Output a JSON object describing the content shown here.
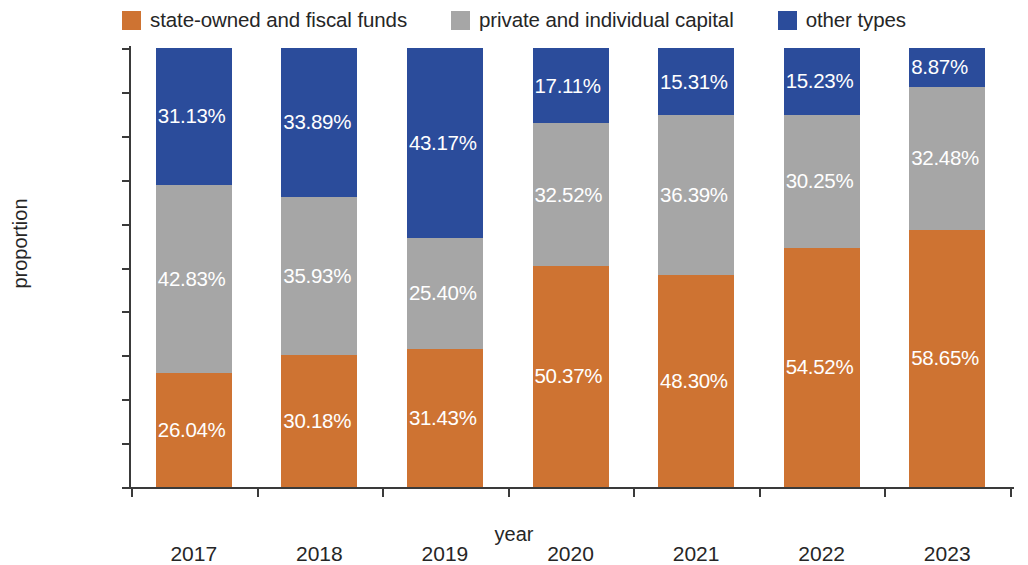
{
  "chart_data": {
    "type": "bar",
    "subtype": "stacked-percent",
    "title": "",
    "xlabel": "year",
    "ylabel": "proportion",
    "categories": [
      "2017",
      "2018",
      "2019",
      "2020",
      "2021",
      "2022",
      "2023"
    ],
    "ylim": [
      0,
      100
    ],
    "ytick_labels": [
      "100.00%",
      "90.00%",
      "80.00%",
      "70.00%",
      "60.00%",
      "50.00%",
      "40.00%",
      "30.00%",
      "20.00%",
      "10.00%",
      "0"
    ],
    "ytick_values": [
      100,
      90,
      80,
      70,
      60,
      50,
      40,
      30,
      20,
      10,
      0
    ],
    "grid": false,
    "legend_position": "top-center",
    "series": [
      {
        "name": "state-owned and fiscal funds",
        "color": "#CE7332",
        "values": [
          26.04,
          30.18,
          31.43,
          50.37,
          48.3,
          54.52,
          58.65
        ],
        "labels": [
          "26.04%",
          "30.18%",
          "31.43%",
          "50.37%",
          "48.30%",
          "54.52%",
          "58.65%"
        ]
      },
      {
        "name": "private and individual capital",
        "color": "#A6A6A6",
        "values": [
          42.83,
          35.93,
          25.4,
          32.52,
          36.39,
          30.25,
          32.48
        ],
        "labels": [
          "42.83%",
          "35.93%",
          "25.40%",
          "32.52%",
          "36.39%",
          "30.25%",
          "32.48%"
        ]
      },
      {
        "name": "other types",
        "color": "#2B4C9B",
        "values": [
          31.13,
          33.89,
          43.17,
          17.11,
          15.31,
          15.23,
          8.87
        ],
        "labels": [
          "31.13%",
          "33.89%",
          "43.17%",
          "17.11%",
          "15.31%",
          "15.23%",
          "8.87%"
        ]
      }
    ]
  },
  "legend": {
    "items": [
      {
        "label": "state-owned and fiscal funds",
        "color": "#CE7332"
      },
      {
        "label": "private and individual capital",
        "color": "#A6A6A6"
      },
      {
        "label": "other types",
        "color": "#2B4C9B"
      }
    ]
  },
  "axes": {
    "x_title": "year",
    "y_title": "proportion"
  },
  "colors": {
    "axis": "#3a3a3a",
    "text": "#262626",
    "label_text": "#ffffff",
    "background": "#ffffff"
  }
}
